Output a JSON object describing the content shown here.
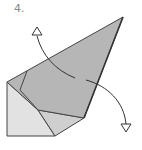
{
  "diagram": {
    "step_label": "4.",
    "colors": {
      "background": "#ffffff",
      "flap_fill": "#b4b4b4",
      "base_fill": "#e0e0e0",
      "mid_fill": "#c8c8c8",
      "outline": "#444444",
      "label": "#888888"
    },
    "arrows": [
      {
        "name": "arrow-up-left",
        "direction": "up",
        "head": "open-triangle"
      },
      {
        "name": "arrow-down-right",
        "direction": "down",
        "head": "open-triangle"
      }
    ]
  }
}
